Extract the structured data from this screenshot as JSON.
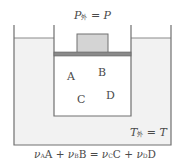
{
  "diagram": {
    "top_label": {
      "symbol": "P",
      "subscript": "外",
      "equals": "= P"
    },
    "bottom_right_label": {
      "symbol": "T",
      "subscript": "外",
      "equals": "= T"
    },
    "species": [
      "A",
      "B",
      "C",
      "D"
    ],
    "equation": {
      "text": "νAA + νBB = νCC + νDD",
      "lhs": [
        {
          "coef": "ν",
          "coef_sub": "A",
          "species": "A"
        },
        {
          "coef": "ν",
          "coef_sub": "B",
          "species": "B"
        }
      ],
      "rhs": [
        {
          "coef": "ν",
          "coef_sub": "C",
          "species": "C"
        },
        {
          "coef": "ν",
          "coef_sub": "D",
          "species": "D"
        }
      ],
      "plus": "+",
      "eq": "="
    },
    "colors": {
      "bath": "#f2f2f2",
      "wall": "#707070",
      "piston": "#8a8a8a",
      "block": "#d4d4d4",
      "gas": "#ffffff"
    }
  }
}
